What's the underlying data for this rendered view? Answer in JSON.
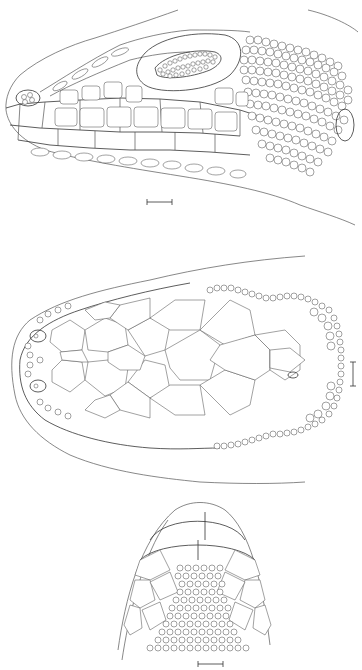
{
  "figure": {
    "panels": [
      {
        "id": "lateral",
        "view": "lateral view of lizard head",
        "scale_bar": true
      },
      {
        "id": "dorsal",
        "view": "dorsal view of lizard head",
        "scale_bar": true
      },
      {
        "id": "ventral",
        "view": "ventral view of chin/throat",
        "scale_bar": true
      }
    ],
    "colors": {
      "background": "#ffffff",
      "line": "#555555"
    }
  }
}
